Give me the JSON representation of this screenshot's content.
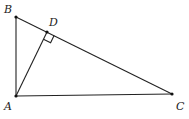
{
  "figure": {
    "type": "right-triangle-with-altitude",
    "points": {
      "A": {
        "label": "A",
        "x": 16,
        "y": 96
      },
      "B": {
        "label": "B",
        "x": 16,
        "y": 17
      },
      "C": {
        "label": "C",
        "x": 172,
        "y": 94
      },
      "D": {
        "label": "D",
        "x": 47,
        "y": 32
      }
    },
    "segments": [
      "AB",
      "BC",
      "AC",
      "AD"
    ],
    "right_angle_marker": "D",
    "colors": {
      "stroke": "#222222",
      "background": "#ffffff"
    }
  }
}
